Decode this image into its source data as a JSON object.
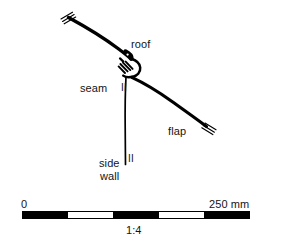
{
  "figure": {
    "type": "technical-cross-section-diagram",
    "background_color": "#ffffff",
    "line_color": "#000000"
  },
  "labels": {
    "roof": "roof",
    "seam": "seam",
    "seam_marker": "II",
    "flap": "flap",
    "side": "side",
    "wall": "wall",
    "side_wall_marker": "II"
  },
  "scale": {
    "start_label": "0",
    "end_label": "250 mm",
    "ratio_label": "1:4",
    "units": "mm",
    "min_value": 0,
    "max_value": 250,
    "segment_count": 5,
    "segment_pattern": [
      "dark",
      "light",
      "dark",
      "light",
      "dark"
    ],
    "bar_color_dark": "#000000",
    "bar_color_light": "#ffffff",
    "bar_border_color": "#000000"
  },
  "annotations": {
    "break_mark_upper_left": "double-slash-break",
    "break_mark_flap_end": "double-slash-break"
  }
}
